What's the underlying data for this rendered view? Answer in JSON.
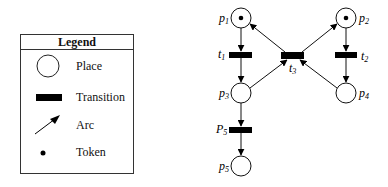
{
  "legend": {
    "title": "Legend",
    "items": [
      {
        "symbol": "place-circle",
        "label": "Place"
      },
      {
        "symbol": "transition-bar",
        "label": "Transition"
      },
      {
        "symbol": "arc-arrow",
        "label": "Arc"
      },
      {
        "symbol": "token-dot",
        "label": "Token"
      }
    ]
  },
  "petri_net": {
    "places": [
      {
        "id": "p1",
        "label": "p",
        "sub": "1",
        "tokens": 1
      },
      {
        "id": "p2",
        "label": "p",
        "sub": "2",
        "tokens": 1
      },
      {
        "id": "p3",
        "label": "p",
        "sub": "3",
        "tokens": 0
      },
      {
        "id": "p4",
        "label": "p",
        "sub": "4",
        "tokens": 0
      },
      {
        "id": "p5",
        "label": "p",
        "sub": "5",
        "tokens": 0
      }
    ],
    "transitions": [
      {
        "id": "t1",
        "label": "t",
        "sub": "1"
      },
      {
        "id": "t2",
        "label": "t",
        "sub": "2"
      },
      {
        "id": "t3",
        "label": "t",
        "sub": "3"
      },
      {
        "id": "t4",
        "label": "P",
        "sub": "5"
      }
    ],
    "arcs": [
      [
        "p1",
        "t1"
      ],
      [
        "t1",
        "p3"
      ],
      [
        "p3",
        "t3"
      ],
      [
        "t3",
        "p1"
      ],
      [
        "p2",
        "t2"
      ],
      [
        "t2",
        "p4"
      ],
      [
        "p4",
        "t3"
      ],
      [
        "t3",
        "p2"
      ],
      [
        "p3",
        "t4"
      ],
      [
        "t4",
        "p5"
      ]
    ]
  }
}
